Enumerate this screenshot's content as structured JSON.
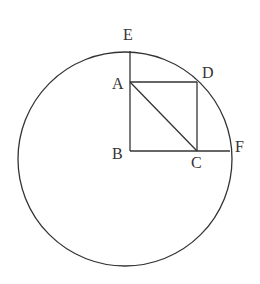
{
  "diagram": {
    "type": "geometry",
    "labels": {
      "E": "E",
      "A": "A",
      "D": "D",
      "B": "B",
      "C": "C",
      "F": "F"
    },
    "colors": {
      "stroke": "#333333",
      "background": "#ffffff"
    }
  }
}
